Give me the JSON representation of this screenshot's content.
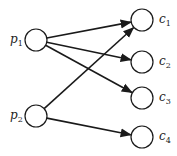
{
  "diagram": {
    "type": "bipartite-directed-graph",
    "left_nodes": [
      {
        "id": "p1",
        "label": "p",
        "subscript": "1",
        "cx": 36,
        "cy": 40
      },
      {
        "id": "p2",
        "label": "p",
        "subscript": "2",
        "cx": 36,
        "cy": 116
      }
    ],
    "right_nodes": [
      {
        "id": "c1",
        "label": "c",
        "subscript": "1",
        "cx": 142,
        "cy": 20
      },
      {
        "id": "c2",
        "label": "c",
        "subscript": "2",
        "cx": 142,
        "cy": 62
      },
      {
        "id": "c3",
        "label": "c",
        "subscript": "3",
        "cx": 142,
        "cy": 98
      },
      {
        "id": "c4",
        "label": "c",
        "subscript": "4",
        "cx": 142,
        "cy": 137
      }
    ],
    "edges": [
      {
        "from": "p1",
        "to": "c1"
      },
      {
        "from": "p1",
        "to": "c2"
      },
      {
        "from": "p1",
        "to": "c3"
      },
      {
        "from": "p2",
        "to": "c1"
      },
      {
        "from": "p2",
        "to": "c4"
      }
    ],
    "node_radius": 11,
    "stroke_color": "#1a1a1a"
  }
}
